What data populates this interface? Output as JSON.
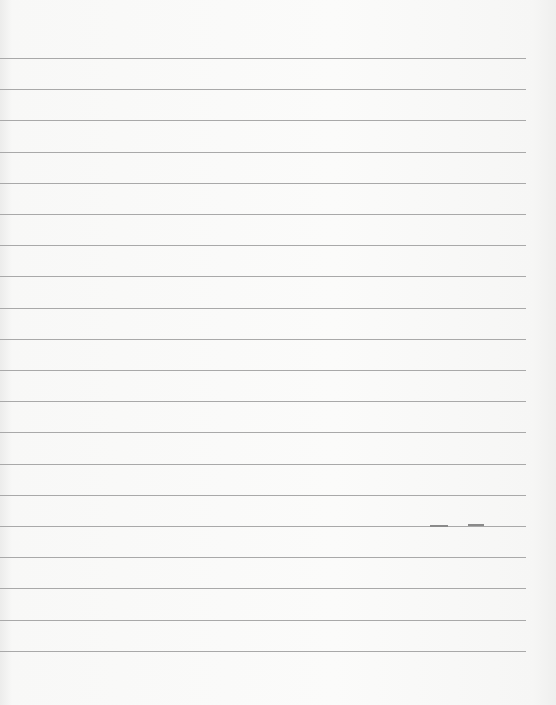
{
  "paper": {
    "type": "lined-paper",
    "line_color": "#a9a9a9",
    "background_color": "#f8f8f7",
    "line_count": 20,
    "first_line_y": 58,
    "line_spacing": 31.2,
    "line_end_x": 526,
    "marks": [
      {
        "x": 430,
        "y": 525,
        "width": 18
      },
      {
        "x": 468,
        "y": 524,
        "width": 16
      }
    ]
  }
}
